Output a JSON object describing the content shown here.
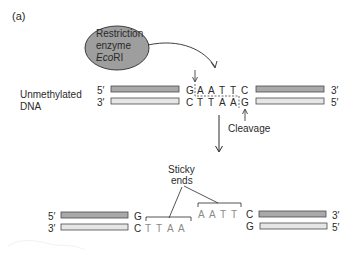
{
  "panel_label": "(a)",
  "enzyme": {
    "line1": "Restriction",
    "line2": "enzyme",
    "line3_italic": "Eco",
    "line3_rest": "RI",
    "fill": "#9e9e9e"
  },
  "dna_label": {
    "line1": "Unmethylated",
    "line2": "DNA"
  },
  "top_row": {
    "left_top_end": "5′",
    "left_bottom_end": "3′",
    "right_top_end": "3′",
    "right_bottom_end": "5′",
    "top_bases": [
      "G",
      "A",
      "A",
      "T",
      "T",
      "C"
    ],
    "bottom_bases": [
      "C",
      "T",
      "T",
      "A",
      "A",
      "G"
    ]
  },
  "cleavage_label": "Cleavage",
  "sticky_label": {
    "line1": "Sticky",
    "line2": "ends"
  },
  "bottom_row": {
    "left_top_end": "5′",
    "left_bottom_end": "3′",
    "right_top_end": "3′",
    "right_bottom_end": "5′",
    "left_top_base": "G",
    "left_bottom_bases": [
      "C",
      "T",
      "T",
      "A",
      "A"
    ],
    "right_overhang_bases": [
      "A",
      "A",
      "T",
      "T"
    ],
    "right_top_base": "C",
    "right_bottom_base": "G"
  },
  "colors": {
    "strand_dark": "#a9a9a9",
    "strand_light": "#e6e6e6",
    "text": "#2a2a2a"
  }
}
